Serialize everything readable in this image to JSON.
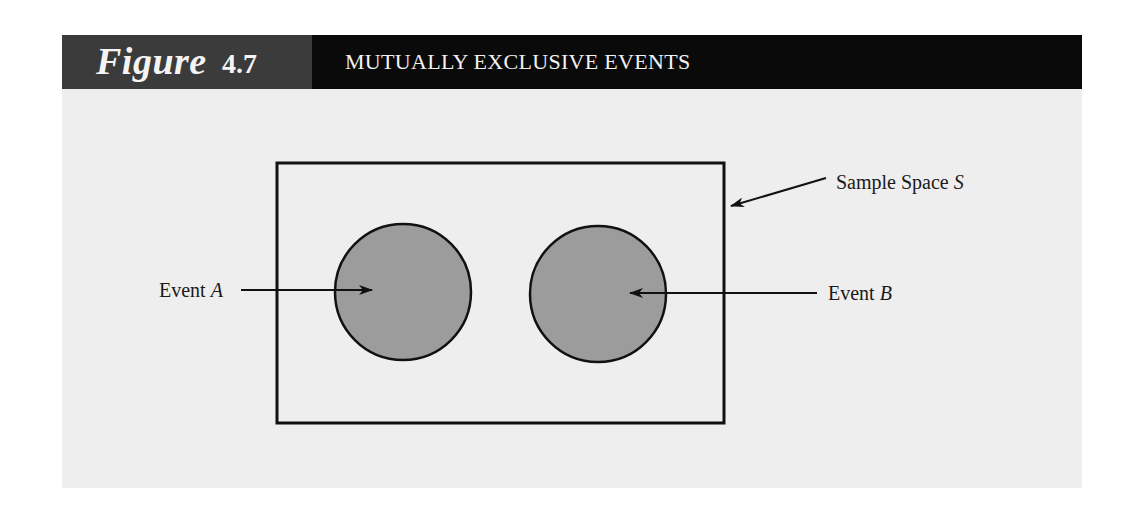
{
  "figure": {
    "label_word": "Figure",
    "number": "4.7",
    "title": "MUTUALLY EXCLUSIVE EVENTS"
  },
  "diagram": {
    "type": "venn",
    "sample_space": {
      "label_prefix": "Sample Space ",
      "label_symbol": "S"
    },
    "events": [
      {
        "label_prefix": "Event ",
        "label_symbol": "A"
      },
      {
        "label_prefix": "Event ",
        "label_symbol": "B"
      }
    ],
    "overlap": "none"
  },
  "colors": {
    "header_label_bg": "#3b3b3b",
    "header_title_bg": "#0a0a0a",
    "panel_bg": "#eeeeee",
    "event_fill": "#9c9c9c",
    "stroke": "#111111"
  }
}
